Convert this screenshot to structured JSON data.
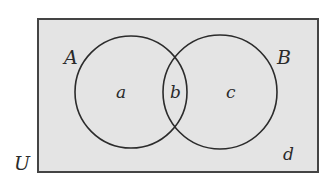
{
  "diagram": {
    "type": "venn",
    "universe_label": "U",
    "sets": [
      {
        "label": "A"
      },
      {
        "label": "B"
      }
    ],
    "regions": {
      "a": "a",
      "b": "b",
      "c": "c",
      "d": "d"
    },
    "colors": {
      "background": "#e4e4e4",
      "stroke": "#2b2b2b"
    }
  }
}
